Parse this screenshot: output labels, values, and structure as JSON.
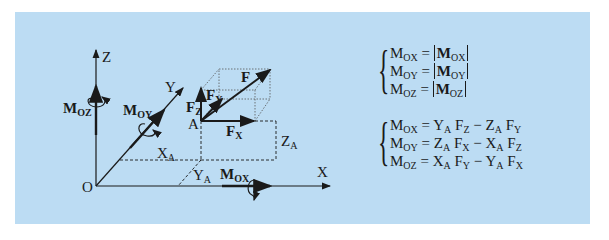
{
  "panel": {
    "background": "#bcdcf3"
  },
  "diagram": {
    "axes": {
      "x_label": "X",
      "y_label": "Y",
      "z_label": "Z",
      "origin_label": "O"
    },
    "point_label": "A",
    "force": {
      "main": "F",
      "components": {
        "x": {
          "base": "F",
          "sub": "X"
        },
        "y": {
          "base": "F",
          "sub": "Y"
        },
        "z": {
          "base": "F",
          "sub": "Z"
        }
      }
    },
    "coordinates": {
      "xa": {
        "base": "X",
        "sub": "A"
      },
      "ya": {
        "base": "Y",
        "sub": "A"
      },
      "za": {
        "base": "Z",
        "sub": "A"
      }
    },
    "moments": {
      "ox": {
        "base": "M",
        "sub": "OX"
      },
      "oy": {
        "base": "M",
        "sub": "OY"
      },
      "oz": {
        "base": "M",
        "sub": "OZ"
      }
    }
  },
  "equations": {
    "magnitudes": [
      {
        "lhs_base": "M",
        "lhs_sub": "OX",
        "op": "=",
        "rhs_base": "M",
        "rhs_sub": "OX"
      },
      {
        "lhs_base": "M",
        "lhs_sub": "OY",
        "op": "=",
        "rhs_base": "M",
        "rhs_sub": "OY"
      },
      {
        "lhs_base": "M",
        "lhs_sub": "OZ",
        "op": "=",
        "rhs_base": "M",
        "rhs_sub": "OZ"
      }
    ],
    "components": [
      {
        "lhs_base": "M",
        "lhs_sub": "OX",
        "op": "=",
        "t1a": "Y",
        "t1a_sub": "A",
        "t1b": "F",
        "t1b_sub": "Z",
        "minus": "−",
        "t2a": "Z",
        "t2a_sub": "A",
        "t2b": "F",
        "t2b_sub": "Y"
      },
      {
        "lhs_base": "M",
        "lhs_sub": "OY",
        "op": "=",
        "t1a": "Z",
        "t1a_sub": "A",
        "t1b": "F",
        "t1b_sub": "X",
        "minus": "−",
        "t2a": "X",
        "t2a_sub": "A",
        "t2b": "F",
        "t2b_sub": "Z"
      },
      {
        "lhs_base": "M",
        "lhs_sub": "OZ",
        "op": "=",
        "t1a": "X",
        "t1a_sub": "A",
        "t1b": "F",
        "t1b_sub": "Y",
        "minus": "−",
        "t2a": "Y",
        "t2a_sub": "A",
        "t2b": "F",
        "t2b_sub": "X"
      }
    ],
    "brace": "{"
  }
}
